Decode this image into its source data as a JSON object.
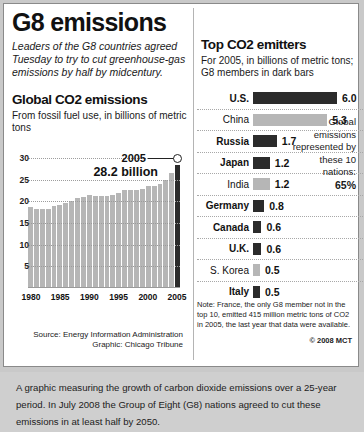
{
  "header": {
    "title": "G8 emissions",
    "deck": "Leaders of the G8 countries agreed Tuesday to try to cut greenhouse-gas emissions by half by midcentury."
  },
  "left": {
    "section_title": "Global CO2 emissions",
    "section_sub": "From fossil fuel use, in billions of metric tons",
    "callout_year": "2005",
    "callout_value": "28.2 billion",
    "source_line1": "Source: Energy Information Administration",
    "source_line2": "Graphic: Chicago Tribune"
  },
  "right": {
    "section_title": "Top CO2 emitters",
    "section_sub": "For 2005, in billions of metric tons; G8 members in dark bars",
    "sidebox_text": "Global emissions represented by these 10 nations:",
    "sidebox_value": "65%",
    "note": "Note: France, the only G8 member not in the top 10, emitted 415 million metric tons of CO2 in 2005, the last year that data were available.",
    "copyright": "© 2008 MCT"
  },
  "caption": {
    "text": "A graphic measuring the growth of carbon dioxide emissions over a 25-year period. In July 2008 the Group of Eight (G8) nations agreed to cut these emissions in at least half by 2050."
  },
  "colors": {
    "bar_light": "#b6b6b6",
    "bar_dark": "#2b2b2b",
    "panel_bg": "#ffffff",
    "frame_bg": "#c9c9c9",
    "caption_bg": "#cfcfcf"
  },
  "chart_data": [
    {
      "type": "bar",
      "title": "Global CO2 emissions",
      "subtitle": "From fossil fuel use, in billions of metric tons",
      "xlabel": "",
      "ylabel": "billions of metric tons",
      "ylim": [
        0,
        30
      ],
      "yticks": [
        5,
        10,
        15,
        20,
        25,
        30
      ],
      "grid": true,
      "xticks": [
        "1980",
        "1985",
        "1990",
        "1995",
        "2000",
        "2005"
      ],
      "annotation": {
        "year": "2005",
        "value": "28.2 billion"
      },
      "categories": [
        "1980",
        "1981",
        "1982",
        "1983",
        "1984",
        "1985",
        "1986",
        "1987",
        "1988",
        "1989",
        "1990",
        "1991",
        "1992",
        "1993",
        "1994",
        "1995",
        "1996",
        "1997",
        "1998",
        "1999",
        "2000",
        "2001",
        "2002",
        "2003",
        "2004",
        "2005"
      ],
      "values": [
        18.5,
        18.0,
        17.9,
        17.9,
        18.6,
        19.0,
        19.4,
        19.9,
        20.5,
        20.8,
        21.2,
        21.1,
        21.0,
        21.1,
        21.3,
        21.7,
        22.3,
        22.5,
        22.5,
        22.6,
        23.3,
        23.4,
        23.7,
        24.6,
        26.2,
        28.2
      ],
      "highlight_index": 25
    },
    {
      "type": "bar",
      "orientation": "horizontal",
      "title": "Top CO2 emitters",
      "subtitle": "For 2005, in billions of metric tons; G8 members in dark bars",
      "xlim": [
        0,
        6.0
      ],
      "categories": [
        "U.S.",
        "China",
        "Russia",
        "Japan",
        "India",
        "Germany",
        "Canada",
        "U.K.",
        "S. Korea",
        "Italy"
      ],
      "values": [
        6.0,
        5.3,
        1.7,
        1.2,
        1.2,
        0.8,
        0.6,
        0.6,
        0.5,
        0.5
      ],
      "value_labels": [
        "6.0",
        "5.3",
        "1.7",
        "1.2",
        "1.2",
        "0.8",
        "0.6",
        "0.6",
        "0.5",
        "0.5"
      ],
      "g8_member": [
        true,
        false,
        true,
        true,
        false,
        true,
        true,
        true,
        false,
        true
      ]
    }
  ]
}
